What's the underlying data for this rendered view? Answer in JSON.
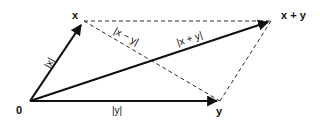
{
  "diagram": {
    "points": {
      "origin": "0",
      "x": "x",
      "y": "y",
      "sum": "x + y"
    },
    "edge_labels": {
      "norm_x": "|x|",
      "norm_y": "|y|",
      "norm_sum": "|x + y|",
      "norm_diff": "|x − y|"
    },
    "colors": {
      "stroke": "#111111",
      "background": "#ffffff"
    }
  }
}
